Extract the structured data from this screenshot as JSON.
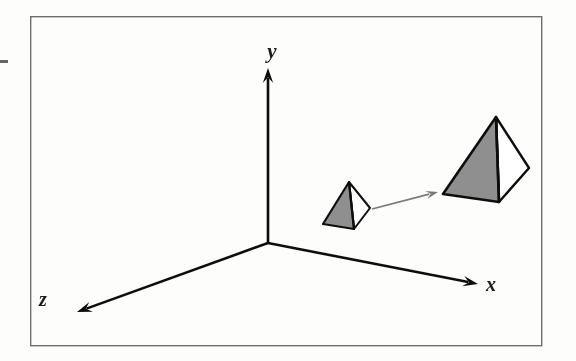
{
  "figure": {
    "kind": "3d-coordinate-diagram",
    "caption_text": "",
    "background_color": "#fdfdfc",
    "frame": {
      "name": "figure-border",
      "color": "#6e6e6e",
      "x": 30,
      "y": 16,
      "width": 512,
      "height": 330,
      "stroke_width": 1.4
    },
    "axes": {
      "origin": {
        "x": 268,
        "y": 243
      },
      "stroke_color": "#111111",
      "stroke_width": 2.6,
      "items": [
        {
          "id": "y-axis",
          "label": "y",
          "label_x": 272,
          "label_y": 58,
          "direction": "up",
          "tip_x": 268,
          "tip_y": 68,
          "start_x": 268,
          "start_y": 243
        },
        {
          "id": "x-axis",
          "label": "x",
          "label_x": 491,
          "label_y": 291,
          "direction": "right-down",
          "tip_x": 478,
          "tip_y": 284,
          "start_x": 268,
          "start_y": 243
        },
        {
          "id": "z-axis",
          "label": "z",
          "label_x": 43,
          "label_y": 306,
          "direction": "left-down",
          "tip_x": 77,
          "tip_y": 312,
          "start_x": 268,
          "start_y": 243
        }
      ]
    },
    "objects": [
      {
        "id": "small-pyramid",
        "name": "Small pyramid (original object)",
        "fill_color": "#8f8f8f",
        "stroke_color": "#111111",
        "stroke_width": 2.2,
        "apex": {
          "x": 349,
          "y": 182
        },
        "front_left": {
          "x": 323,
          "y": 224
        },
        "front_right": {
          "x": 354,
          "y": 229
        },
        "right_back": {
          "x": 370,
          "y": 208
        }
      },
      {
        "id": "large-pyramid",
        "name": "Large pyramid (scaled object)",
        "fill_color": "#8f8f8f",
        "stroke_color": "#111111",
        "stroke_width": 2.6,
        "apex": {
          "x": 496,
          "y": 117
        },
        "front_left": {
          "x": 443,
          "y": 194
        },
        "front_right": {
          "x": 499,
          "y": 202
        },
        "right_back": {
          "x": 529,
          "y": 168
        }
      }
    ],
    "connector_arrow": {
      "id": "transform-arrow",
      "name": "transformation arrow",
      "color": "#7a7a7a",
      "stroke_width": 1.8,
      "start_x": 372,
      "start_y": 209,
      "end_x": 438,
      "end_y": 192
    },
    "artifacts": [
      {
        "id": "scan-mark-left",
        "x": 0,
        "y": 60,
        "width": 8,
        "height": 3,
        "color": "#4a4a4a"
      }
    ]
  }
}
